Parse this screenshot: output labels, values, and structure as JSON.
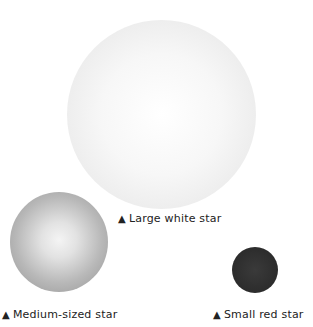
{
  "stars": [
    {
      "id": "large",
      "label": "Large white star",
      "color": "#f2f2f2"
    },
    {
      "id": "medium",
      "label": "Medium-sized star",
      "color": "#b0b0b0"
    },
    {
      "id": "small",
      "label": "Small red star",
      "color": "#2c2c2c"
    }
  ],
  "marker": "▲"
}
